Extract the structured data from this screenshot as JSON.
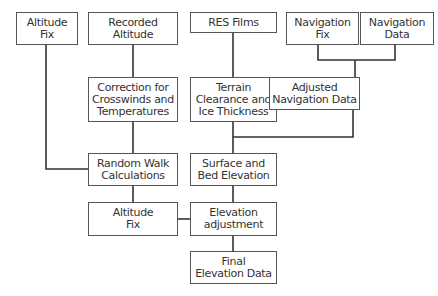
{
  "diagram": {
    "type": "flowchart",
    "nodes": [
      {
        "id": "altitude_fix_top",
        "label": "Altitude\nFix"
      },
      {
        "id": "recorded_altitude",
        "label": "Recorded\nAltitude"
      },
      {
        "id": "res_films",
        "label": "RES Films"
      },
      {
        "id": "navigation_fix",
        "label": "Navigation\nFix"
      },
      {
        "id": "navigation_data",
        "label": "Navigation\nData"
      },
      {
        "id": "correction",
        "label": "Correction for\nCrosswinds and\nTemperatures"
      },
      {
        "id": "terrain",
        "label": "Terrain\nClearance and\nIce Thickness"
      },
      {
        "id": "adjusted_navigation",
        "label": "Adjusted\nNavigation Data"
      },
      {
        "id": "random_walk",
        "label": "Random Walk\nCalculations"
      },
      {
        "id": "surface_bed",
        "label": "Surface and\nBed Elevation"
      },
      {
        "id": "altitude_fix_mid",
        "label": "Altitude\nFix"
      },
      {
        "id": "elevation_adjustment",
        "label": "Elevation\nadjustment"
      },
      {
        "id": "final_elevation",
        "label": "Final\nElevation Data"
      }
    ],
    "edges": [
      [
        "recorded_altitude",
        "correction"
      ],
      [
        "correction",
        "random_walk"
      ],
      [
        "altitude_fix_top",
        "random_walk"
      ],
      [
        "res_films",
        "terrain"
      ],
      [
        "navigation_fix",
        "adjusted_navigation"
      ],
      [
        "navigation_data",
        "adjusted_navigation"
      ],
      [
        "terrain",
        "surface_bed"
      ],
      [
        "adjusted_navigation",
        "surface_bed"
      ],
      [
        "random_walk",
        "altitude_fix_mid"
      ],
      [
        "surface_bed",
        "elevation_adjustment"
      ],
      [
        "altitude_fix_mid",
        "elevation_adjustment"
      ],
      [
        "elevation_adjustment",
        "final_elevation"
      ]
    ]
  }
}
